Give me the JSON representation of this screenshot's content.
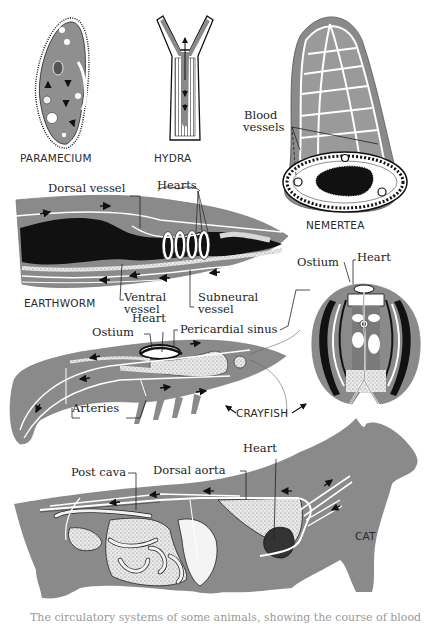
{
  "figure": {
    "colors": {
      "body_gray": "#8a8a8a",
      "dark": "#111111",
      "vessel_white": "#ffffff",
      "stipple": "#d8d8d8"
    },
    "organisms": [
      {
        "id": "paramecium",
        "caption": "PARAMECIUM"
      },
      {
        "id": "hydra",
        "caption": "HYDRA"
      },
      {
        "id": "nemertea",
        "caption": "NEMERTEA"
      },
      {
        "id": "earthworm",
        "caption": "EARTHWORM"
      },
      {
        "id": "crayfish",
        "caption": "CRAYFISH"
      },
      {
        "id": "cat",
        "caption": "CAT"
      }
    ],
    "labels": {
      "nemertea_blood_vessels_1": "Blood",
      "nemertea_blood_vessels_2": "vessels",
      "earthworm_dorsal_vessel": "Dorsal vessel",
      "earthworm_hearts": "Hearts",
      "earthworm_ventral_vessel_1": "Ventral",
      "earthworm_ventral_vessel_2": "vessel",
      "earthworm_subneural_vessel_1": "Subneural",
      "earthworm_subneural_vessel_2": "vessel",
      "crayfish_ostium": "Ostium",
      "crayfish_heart": "Heart",
      "crayfish_pericardial_sinus": "Pericardial sinus",
      "crayfish_arteries": "Arteries",
      "crayfish_section_ostium": "Ostium",
      "crayfish_section_heart": "Heart",
      "cat_heart": "Heart",
      "cat_post_cava": "Post cava",
      "cat_dorsal_aorta": "Dorsal aorta"
    },
    "cut_off_caption": "The circulatory systems of some animals, showing the course of blood"
  }
}
